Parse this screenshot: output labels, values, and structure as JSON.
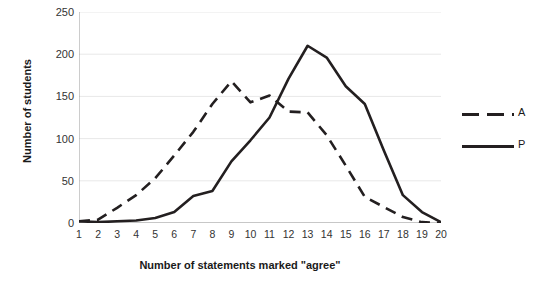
{
  "chart_data": {
    "type": "line",
    "title": "",
    "xlabel": "Number of statements marked \"agree\"",
    "ylabel": "Number of students",
    "x": [
      1,
      2,
      3,
      4,
      5,
      6,
      7,
      8,
      9,
      10,
      11,
      12,
      13,
      14,
      15,
      16,
      17,
      18,
      19,
      20
    ],
    "xtick_labels": [
      "1",
      "2",
      "3",
      "4",
      "5",
      "6",
      "7",
      "8",
      "9",
      "10",
      "11",
      "12",
      "13",
      "14",
      "15",
      "16",
      "17",
      "18",
      "19",
      "20"
    ],
    "ytick_labels": [
      "0",
      "50",
      "100",
      "150",
      "200",
      "250"
    ],
    "yticks": [
      0,
      50,
      100,
      150,
      200,
      250
    ],
    "xlim": [
      1,
      20
    ],
    "ylim": [
      0,
      250
    ],
    "grid": "horizontal",
    "legend_position": "right",
    "series": [
      {
        "name": "A",
        "style": "dashed",
        "color": "#231f20",
        "values": [
          2,
          4,
          18,
          33,
          53,
          80,
          108,
          141,
          168,
          143,
          151,
          132,
          131,
          104,
          68,
          31,
          19,
          7,
          1,
          0
        ]
      },
      {
        "name": "P",
        "style": "solid",
        "color": "#231f20",
        "values": [
          2,
          1,
          2,
          3,
          6,
          13,
          32,
          38,
          73,
          98,
          125,
          171,
          210,
          196,
          162,
          141,
          86,
          33,
          13,
          1
        ]
      }
    ]
  },
  "legend": {
    "entries": [
      {
        "label": "A"
      },
      {
        "label": "P"
      }
    ]
  },
  "axes": {
    "y_title": "Number of students",
    "x_title": "Number of statements marked \"agree\""
  },
  "colors": {
    "line": "#231f20",
    "grid": "#e8e8e8",
    "axis": "#9a9a9a",
    "text": "#1a1a1a",
    "background": "#ffffff"
  }
}
